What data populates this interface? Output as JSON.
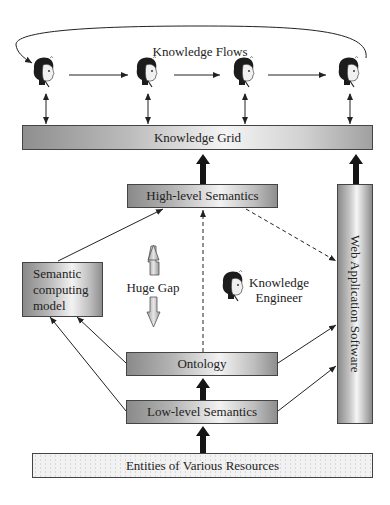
{
  "diagram": {
    "top_label": "Knowledge Flows",
    "nodes": {
      "knowledge_grid": "Knowledge Grid",
      "high_level_semantics": "High-level Semantics",
      "semantic_computing_model": "Semantic computing model",
      "huge_gap": "Huge Gap",
      "knowledge_engineer": "Knowledge Engineer",
      "ontology": "Ontology",
      "low_level_semantics": "Low-level Semantics",
      "web_application_software": "Web Application Software",
      "entities": "Entities of Various Resources"
    },
    "people": [
      {
        "role": "knowledge-worker-1"
      },
      {
        "role": "knowledge-worker-2"
      },
      {
        "role": "knowledge-worker-3"
      },
      {
        "role": "knowledge-worker-4"
      },
      {
        "role": "knowledge-engineer"
      }
    ],
    "colors": {
      "line": "#222222",
      "box_border": "#444444",
      "gap_arrow": "#c8c8c8"
    }
  }
}
